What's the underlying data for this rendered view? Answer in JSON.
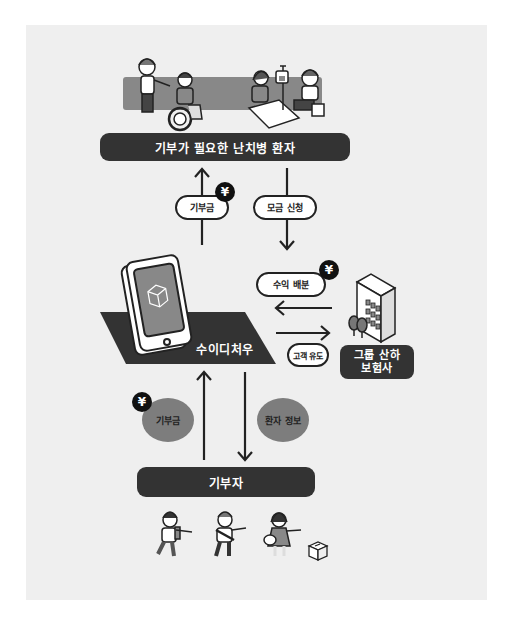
{
  "diagram": {
    "patients_label": "기부가 필요한 난치병 환자",
    "platform_label": "수이디처우",
    "insurer_label_line1": "그룹 산하",
    "insurer_label_line2": "보험사",
    "donor_label": "기부자",
    "flows": {
      "donation_to_patients": "기부금",
      "fundraising_request": "모금 신청",
      "revenue_share": "수익 배분",
      "customer_referral": "고객 유도",
      "donation_from_donors": "기부금",
      "patient_info": "환자 정보"
    },
    "currency_symbol": "¥",
    "colors": {
      "background": "#efefef",
      "dark_bar": "#333333",
      "oval_fill": "#7d7d7d",
      "band_fill": "#888888",
      "pill_fill": "#ffffff"
    }
  }
}
